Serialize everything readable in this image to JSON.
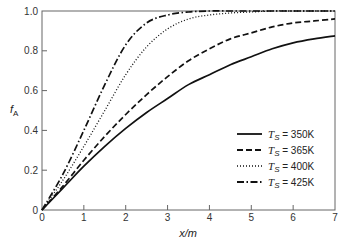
{
  "chart_data": {
    "type": "line",
    "title": "",
    "xlabel": "x/m",
    "ylabel": "fA",
    "ylabel_main": "f",
    "ylabel_sub": "A",
    "xlim": [
      0,
      7
    ],
    "ylim": [
      0,
      1.0
    ],
    "xticks": [
      "0",
      "1",
      "2",
      "3",
      "4",
      "5",
      "6",
      "7"
    ],
    "yticks": [
      "0",
      "0.2",
      "0.4",
      "0.6",
      "0.8",
      "1.0"
    ],
    "grid": false,
    "legend_position": "bottom-right",
    "x": [
      0,
      0.5,
      1,
      1.5,
      2,
      2.5,
      3,
      3.5,
      4,
      4.5,
      5,
      5.5,
      6,
      6.5,
      7
    ],
    "series": [
      {
        "name": "T_S = 350K",
        "label_main": "T",
        "label_sub": "S",
        "label_rest": " = 350K",
        "style": "solid",
        "values": [
          0,
          0.11,
          0.22,
          0.32,
          0.41,
          0.49,
          0.56,
          0.63,
          0.68,
          0.73,
          0.77,
          0.81,
          0.84,
          0.86,
          0.875
        ]
      },
      {
        "name": "T_S = 365K",
        "label_main": "T",
        "label_sub": "S",
        "label_rest": " = 365K",
        "style": "dashed",
        "values": [
          0,
          0.12,
          0.25,
          0.37,
          0.48,
          0.58,
          0.67,
          0.75,
          0.81,
          0.86,
          0.89,
          0.92,
          0.94,
          0.95,
          0.96
        ]
      },
      {
        "name": "T_S = 400K",
        "label_main": "T",
        "label_sub": "S",
        "label_rest": " = 400K",
        "style": "dotted",
        "values": [
          0,
          0.15,
          0.32,
          0.5,
          0.68,
          0.82,
          0.91,
          0.96,
          0.98,
          0.99,
          0.995,
          1.0,
          1.0,
          1.0,
          1.0
        ]
      },
      {
        "name": "T_S = 425K",
        "label_main": "T",
        "label_sub": "S",
        "label_rest": " = 425K",
        "style": "dashdot",
        "values": [
          0,
          0.18,
          0.4,
          0.63,
          0.83,
          0.94,
          0.98,
          0.995,
          1.0,
          1.0,
          1.0,
          1.0,
          1.0,
          1.0,
          1.0
        ]
      }
    ]
  }
}
